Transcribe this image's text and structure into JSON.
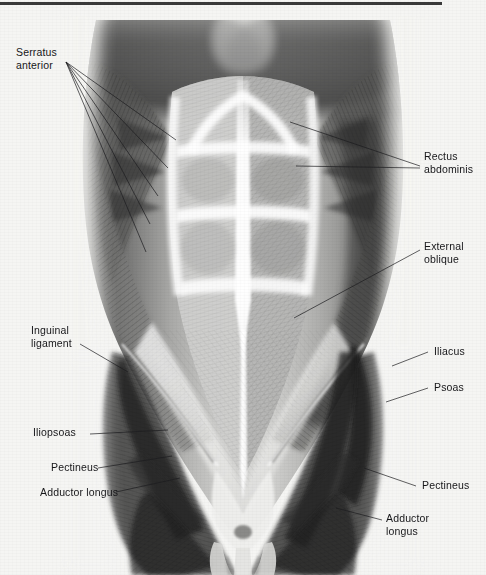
{
  "figure": {
    "top_rule_color": "#3a3a3a",
    "background_color": "#f5f5f3",
    "ink_color": "#17171a",
    "leader_color": "#1d1d20"
  },
  "labels": {
    "serratus_anterior": "Serratus\nanterior",
    "serratus_anterior_line1": "Serratus",
    "serratus_anterior_line2": "anterior",
    "rectus_abdominis_line1": "Rectus",
    "rectus_abdominis_line2": "abdominis",
    "external_oblique_line1": "External",
    "external_oblique_line2": "oblique",
    "inguinal_ligament_line1": "Inguinal",
    "inguinal_ligament_line2": "ligament",
    "iliacus": "Iliacus",
    "psoas": "Psoas",
    "iliopsoas": "Iliopsoas",
    "pectineus_left": "Pectineus",
    "pectineus_right": "Pectineus",
    "adductor_longus_left": "Adductor longus",
    "adductor_longus_right_line1": "Adductor",
    "adductor_longus_right_line2": "longus"
  },
  "structures": [
    {
      "name": "serratus-anterior",
      "side": "left",
      "label": "Serratus anterior",
      "leader_count": 5
    },
    {
      "name": "rectus-abdominis",
      "side": "right",
      "label": "Rectus abdominis",
      "leader_count": 2
    },
    {
      "name": "external-oblique",
      "side": "right",
      "label": "External oblique",
      "leader_count": 1
    },
    {
      "name": "inguinal-ligament",
      "side": "left",
      "label": "Inguinal ligament",
      "leader_count": 1
    },
    {
      "name": "iliacus",
      "side": "right",
      "label": "Iliacus",
      "leader_count": 1
    },
    {
      "name": "psoas",
      "side": "right",
      "label": "Psoas",
      "leader_count": 1
    },
    {
      "name": "iliopsoas",
      "side": "left",
      "label": "Iliopsoas",
      "leader_count": 1
    },
    {
      "name": "pectineus-left",
      "side": "left",
      "label": "Pectineus",
      "leader_count": 1
    },
    {
      "name": "pectineus-right",
      "side": "right",
      "label": "Pectineus",
      "leader_count": 1
    },
    {
      "name": "adductor-longus-left",
      "side": "left",
      "label": "Adductor longus",
      "leader_count": 1
    },
    {
      "name": "adductor-longus-right",
      "side": "right",
      "label": "Adductor longus",
      "leader_count": 1
    }
  ]
}
